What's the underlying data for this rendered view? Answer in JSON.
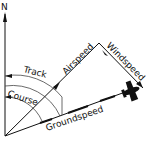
{
  "diagram": {
    "labels": {
      "north": "N",
      "track": "Track",
      "course": "Course",
      "airspeed": "Airspeed",
      "windspeed": "Windspeed",
      "groundspeed": "Groundspeed"
    },
    "icons": {
      "aircraft": "airplane-icon"
    },
    "colors": {
      "ink": "#111111",
      "background": "#ffffff"
    }
  }
}
